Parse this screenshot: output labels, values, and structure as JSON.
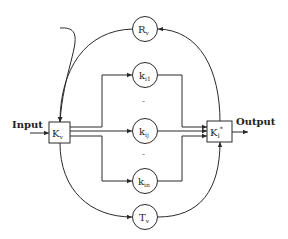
{
  "diagram": {
    "input_label": "Input",
    "output_label": "Output",
    "source_block": {
      "main": "K",
      "sub": "v",
      "sup": ""
    },
    "sink_block": {
      "main": "K",
      "sub": "I",
      "sup": "*"
    },
    "top_node": {
      "main": "R",
      "sub": "v"
    },
    "bottom_node": {
      "main": "T",
      "sub": "v"
    },
    "branch_nodes": [
      {
        "main": "k",
        "sub": "i1"
      },
      {
        "main": "k",
        "sub": "ij"
      },
      {
        "main": "k",
        "sub": "in"
      }
    ],
    "ellipsis": "-",
    "colors": {
      "stroke": "#2a2a2a",
      "text": "#1e1e1e"
    }
  }
}
